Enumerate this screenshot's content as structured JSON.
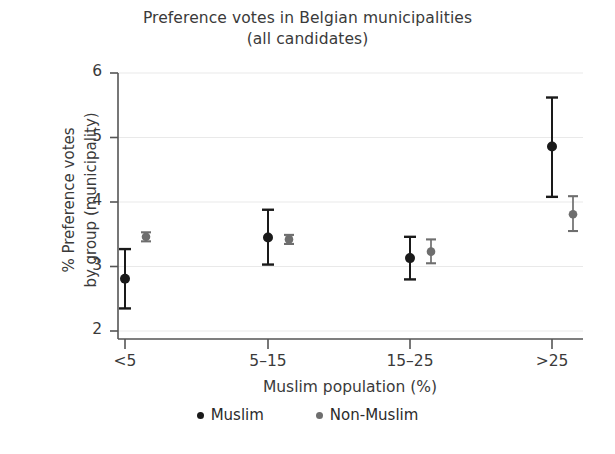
{
  "chart_data": {
    "type": "scatter",
    "title": "Preference votes in Belgian municipalities",
    "subtitle": "(all candidates)",
    "xlabel": "Muslim population (%)",
    "ylabel_line1": "% Preference votes",
    "ylabel_line2": "by group (municipality)",
    "categories": [
      "<5",
      "5–15",
      "15–25",
      ">25"
    ],
    "xtick_labels": [
      "<5",
      "5–15",
      "15–25",
      ">25"
    ],
    "ytick_labels": [
      "2",
      "3",
      "4",
      "5",
      "6"
    ],
    "yticks": [
      2,
      3,
      4,
      5,
      6
    ],
    "ylim": [
      2,
      6
    ],
    "grid": "horizontal",
    "legend_position": "bottom",
    "series": [
      {
        "name": "Muslim",
        "color": "#1a1a1a",
        "values": [
          2.81,
          3.45,
          3.13,
          4.86
        ],
        "ci_low": [
          2.35,
          3.03,
          2.8,
          4.08
        ],
        "ci_high": [
          3.27,
          3.88,
          3.46,
          5.62
        ]
      },
      {
        "name": "Non-Muslim",
        "color": "#6e6e6e",
        "values": [
          3.46,
          3.42,
          3.23,
          3.81
        ],
        "ci_low": [
          3.39,
          3.35,
          3.05,
          3.55
        ],
        "ci_high": [
          3.53,
          3.49,
          3.42,
          4.09
        ]
      }
    ]
  },
  "legend": {
    "items": [
      {
        "label": "Muslim",
        "color": "#1a1a1a"
      },
      {
        "label": "Non-Muslim",
        "color": "#6e6e6e"
      }
    ]
  },
  "axes": {
    "axis_color": "#555555",
    "grid_color": "#e9e9e9"
  }
}
